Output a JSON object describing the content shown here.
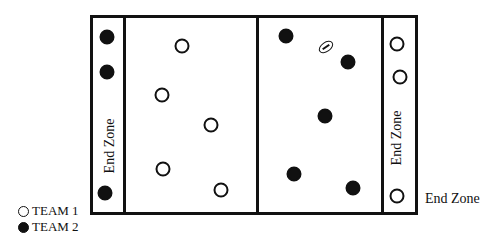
{
  "diagram": {
    "left_end_zone_label": "End Zone",
    "right_end_zone_label": "End Zone",
    "outside_caption": "End Zone",
    "legend": [
      {
        "label": "TEAM 1",
        "style": "hollow-circle"
      },
      {
        "label": "TEAM 2",
        "style": "filled-circle"
      }
    ],
    "colors": {
      "ink": "#111111",
      "background": "#ffffff"
    },
    "players_team1": [
      {
        "x": 182,
        "y": 46
      },
      {
        "x": 162,
        "y": 95
      },
      {
        "x": 211,
        "y": 125
      },
      {
        "x": 163,
        "y": 169
      },
      {
        "x": 221,
        "y": 190
      },
      {
        "x": 397,
        "y": 44
      },
      {
        "x": 400,
        "y": 77
      },
      {
        "x": 397,
        "y": 196
      }
    ],
    "players_team2": [
      {
        "x": 107,
        "y": 37
      },
      {
        "x": 107,
        "y": 72
      },
      {
        "x": 105,
        "y": 193
      },
      {
        "x": 286,
        "y": 36
      },
      {
        "x": 348,
        "y": 62
      },
      {
        "x": 325,
        "y": 116
      },
      {
        "x": 294,
        "y": 174
      },
      {
        "x": 353,
        "y": 188
      }
    ],
    "ball": {
      "x": 326,
      "y": 47
    }
  }
}
